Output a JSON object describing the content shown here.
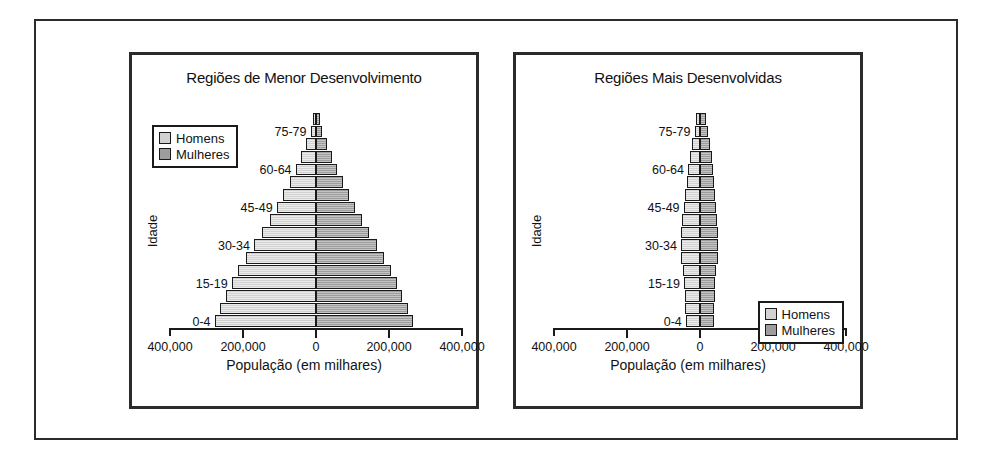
{
  "figure": {
    "panels": [
      {
        "id": "less-developed",
        "title": "Regiões de Menor Desenvolvimento",
        "legend_position": "top-left"
      },
      {
        "id": "more-developed",
        "title": "Regiões Mais Desenvolvidas",
        "legend_position": "bottom-right"
      }
    ],
    "legend": {
      "male_label": "Homens",
      "female_label": "Mulheres",
      "male_color": "#d2d2d2",
      "female_color": "#9d9d9d"
    },
    "axis": {
      "ylabel": "Idade",
      "xlabel": "População (em milhares)",
      "xticklabels": [
        "400,000",
        "200,000",
        "0",
        "200,000",
        "400,000"
      ],
      "xtickvalues": [
        -400000,
        -200000,
        0,
        200000,
        400000
      ],
      "age_labels_shown": [
        "0-4",
        "15-19",
        "30-34",
        "45-49",
        "60-64",
        "75-79"
      ]
    }
  },
  "chart_data": [
    {
      "type": "bar",
      "subtype": "population-pyramid",
      "title": "Regiões de Menor Desenvolvimento",
      "xlabel": "População (em milhares)",
      "ylabel": "Idade",
      "xlim": [
        -400000,
        400000
      ],
      "xticks": [
        -400000,
        -200000,
        0,
        200000,
        400000
      ],
      "xticklabels": [
        "400,000",
        "200,000",
        "0",
        "200,000",
        "400,000"
      ],
      "grid": false,
      "legend": [
        "Homens",
        "Mulheres"
      ],
      "legend_position": "top-left",
      "categories": [
        "0-4",
        "5-9",
        "10-14",
        "15-19",
        "20-24",
        "25-29",
        "30-34",
        "35-39",
        "40-44",
        "45-49",
        "50-54",
        "55-59",
        "60-64",
        "65-69",
        "70-74",
        "75-79",
        "80+"
      ],
      "series": [
        {
          "name": "Homens",
          "values": [
            278000,
            262000,
            246000,
            231000,
            213000,
            192000,
            170000,
            148000,
            127000,
            108000,
            90000,
            72000,
            56000,
            41000,
            27000,
            15000,
            9000
          ]
        },
        {
          "name": "Mulheres",
          "values": [
            266000,
            251000,
            236000,
            222000,
            206000,
            187000,
            167000,
            146000,
            126000,
            108000,
            91000,
            74000,
            58000,
            43000,
            29000,
            17000,
            11000
          ]
        }
      ]
    },
    {
      "type": "bar",
      "subtype": "population-pyramid",
      "title": "Regiões Mais Desenvolvidas",
      "xlabel": "População (em milhares)",
      "ylabel": "Idade",
      "xlim": [
        -400000,
        400000
      ],
      "xticks": [
        -400000,
        -200000,
        0,
        200000,
        400000
      ],
      "xticklabels": [
        "400,000",
        "200,000",
        "0",
        "200,000",
        "400,000"
      ],
      "grid": false,
      "legend": [
        "Homens",
        "Mulheres"
      ],
      "legend_position": "bottom-right",
      "categories": [
        "0-4",
        "5-9",
        "10-14",
        "15-19",
        "20-24",
        "25-29",
        "30-34",
        "35-39",
        "40-44",
        "45-49",
        "50-54",
        "55-59",
        "60-64",
        "65-69",
        "70-74",
        "75-79",
        "80+"
      ],
      "series": [
        {
          "name": "Homens",
          "values": [
            39000,
            41000,
            42000,
            44000,
            47000,
            51000,
            52000,
            51000,
            48000,
            45000,
            40000,
            36000,
            33000,
            28000,
            22000,
            15000,
            10000
          ]
        },
        {
          "name": "Mulheres",
          "values": [
            37000,
            39000,
            40000,
            42000,
            45000,
            49000,
            50000,
            49000,
            47000,
            45000,
            41000,
            38000,
            36000,
            32000,
            27000,
            21000,
            17000
          ]
        }
      ]
    }
  ]
}
